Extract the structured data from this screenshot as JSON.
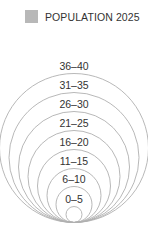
{
  "legend": {
    "label": "POPULATION  2025",
    "swatch_color": "#b8b8b8"
  },
  "chart_data": {
    "type": "nested-circles",
    "title": "",
    "legend": [
      "POPULATION 2025"
    ],
    "categories": [
      "0–5",
      "6–10",
      "11–15",
      "16–20",
      "21–25",
      "26–30",
      "31–35",
      "36–40"
    ],
    "labels_top_to_bottom": [
      "36–40",
      "31–35",
      "26–30",
      "21–25",
      "16–20",
      "11–15",
      "6–10",
      "0–5"
    ],
    "ring_stroke_color": "#b0b0b0",
    "layout": {
      "tangent_bottom": true,
      "legend_position": "top-left"
    }
  },
  "rings": [
    {
      "label": "36–40",
      "r": 74.5
    },
    {
      "label": "31–35",
      "r": 65
    },
    {
      "label": "26–30",
      "r": 55.5
    },
    {
      "label": "21–25",
      "r": 46
    },
    {
      "label": "16–20",
      "r": 36.5
    },
    {
      "label": "11–15",
      "r": 27
    },
    {
      "label": "6–10",
      "r": 18
    },
    {
      "label": "0–5",
      "r": 8
    }
  ]
}
